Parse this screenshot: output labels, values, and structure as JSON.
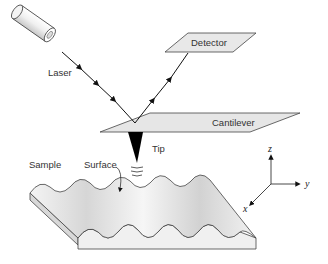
{
  "diagram": {
    "labels": {
      "laser": "Laser",
      "detector": "Detector",
      "cantilever": "Cantilever",
      "tip": "Tip",
      "sample": "Sample",
      "surface": "Surface"
    },
    "axes": {
      "x": "x",
      "y": "y",
      "z": "z"
    },
    "colors": {
      "fill_light": "#e6e6e6",
      "stroke": "#333333",
      "beam": "#111111",
      "tip": "#000000"
    }
  }
}
